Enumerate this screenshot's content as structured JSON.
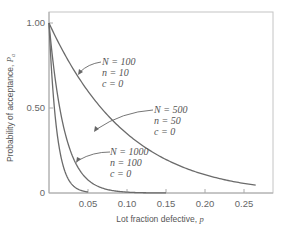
{
  "chart_data": {
    "type": "line",
    "title": "",
    "xlabel": "Lot fraction defective, p",
    "ylabel": "Probability of acceptance, Pa",
    "xlim": [
      0,
      0.29
    ],
    "ylim": [
      0,
      1.0
    ],
    "x_ticks": [
      "0.05",
      "0.10",
      "0.15",
      "0.20",
      "0.25"
    ],
    "y_ticks": [
      "0",
      "0.50",
      "1.00"
    ],
    "grid": false,
    "legend": "none (inline annotations with arrows)",
    "series": [
      {
        "name": "N = 100, n = 10, c = 0",
        "n": 10,
        "p_max": 0.265,
        "x": [
          0,
          0.025,
          0.05,
          0.075,
          0.1,
          0.125,
          0.15,
          0.175,
          0.2,
          0.225,
          0.25,
          0.265
        ],
        "values": [
          1.0,
          0.78,
          0.6,
          0.46,
          0.35,
          0.26,
          0.2,
          0.15,
          0.11,
          0.08,
          0.06,
          0.05
        ]
      },
      {
        "name": "N = 500, n = 50, c = 0",
        "n": 50,
        "p_max": 0.15,
        "x": [
          0,
          0.01,
          0.02,
          0.03,
          0.05,
          0.075,
          0.1,
          0.125,
          0.15
        ],
        "values": [
          1.0,
          0.61,
          0.36,
          0.22,
          0.08,
          0.02,
          0.005,
          0.001,
          0.0003
        ]
      },
      {
        "name": "N = 1000, n = 100, c = 0",
        "n": 100,
        "p_max": 0.05,
        "x": [
          0,
          0.005,
          0.01,
          0.02,
          0.03,
          0.04,
          0.05
        ],
        "values": [
          1.0,
          0.61,
          0.37,
          0.13,
          0.05,
          0.02,
          0.006
        ]
      }
    ],
    "annotations": [
      {
        "lines": [
          "N = 100",
          "n = 10",
          "c = 0"
        ],
        "target": "N = 100 curve"
      },
      {
        "lines": [
          "N = 500",
          "n = 50",
          "c = 0"
        ],
        "target": "N = 500 curve"
      },
      {
        "lines": [
          "N = 1000",
          "n = 100",
          "c = 0"
        ],
        "target": "N = 1000 curve"
      }
    ]
  },
  "labels": {
    "xlabel_text": "Lot fraction defective, ",
    "xlabel_var": "p",
    "ylabel_text": "Probability of acceptance, ",
    "ylabel_var": "P",
    "ylabel_sub": "a",
    "y_tick_0": "0",
    "y_tick_050": "0.50",
    "y_tick_100": "1.00",
    "x_tick_005": "0.05",
    "x_tick_010": "0.10",
    "x_tick_015": "0.15",
    "x_tick_020": "0.20",
    "x_tick_025": "0.25",
    "a1_l1": "N = 100",
    "a1_l2": "n = 10",
    "a1_l3": "c = 0",
    "a2_l1": "N = 500",
    "a2_l2": "n = 50",
    "a2_l3": "c = 0",
    "a3_l1": "N = 1000",
    "a3_l2": "n = 100",
    "a3_l3": "c = 0"
  },
  "colors": {
    "curve": "#6b6b6b",
    "frame": "#b8b8b8",
    "text": "#555555"
  }
}
